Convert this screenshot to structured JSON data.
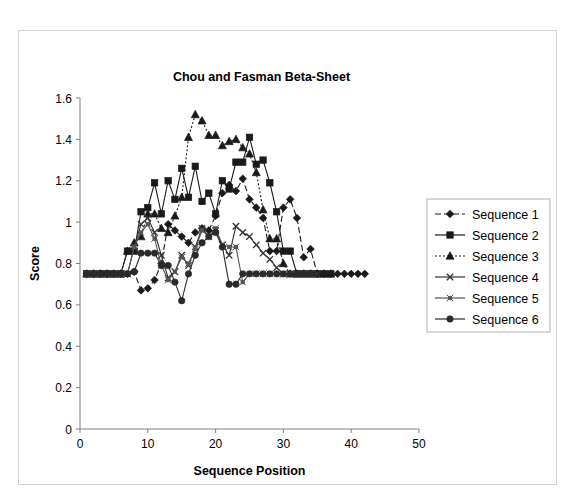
{
  "figure": {
    "border_color": "#d3d3d3",
    "background": "#ffffff"
  },
  "chart_data": {
    "type": "line",
    "title": "Chou and Fasman Beta-Sheet",
    "xlabel": "Sequence Position",
    "ylabel": "Score",
    "xlim": [
      0,
      50
    ],
    "ylim": [
      0,
      1.6
    ],
    "xticks": [
      0,
      10,
      20,
      30,
      40,
      50
    ],
    "yticks": [
      0,
      0.2,
      0.4,
      0.6,
      0.8,
      1,
      1.2,
      1.4,
      1.6
    ],
    "xtick_labels": [
      "0",
      "10",
      "20",
      "30",
      "40",
      "50"
    ],
    "ytick_labels": [
      "0",
      "0.2",
      "0.4",
      "0.6",
      "0.8",
      "1",
      "1.2",
      "1.4",
      "1.6"
    ],
    "grid": false,
    "legend_position": "right",
    "baseline_value": 0.75,
    "series": [
      {
        "name": "Sequence 1",
        "marker": "diamond",
        "linestyle": "dashed",
        "color": "#1a1a1a",
        "x": [
          1,
          2,
          3,
          4,
          5,
          6,
          7,
          8,
          9,
          10,
          11,
          12,
          13,
          14,
          15,
          16,
          17,
          18,
          19,
          20,
          21,
          22,
          23,
          24,
          25,
          26,
          27,
          28,
          29,
          30,
          31,
          32,
          33,
          34,
          35,
          36,
          37,
          38,
          39,
          40,
          41,
          42
        ],
        "y": [
          0.75,
          0.75,
          0.75,
          0.75,
          0.75,
          0.75,
          0.75,
          0.76,
          0.67,
          0.68,
          0.72,
          0.8,
          0.99,
          0.96,
          0.93,
          0.9,
          0.95,
          0.97,
          0.96,
          1.03,
          1.14,
          1.18,
          1.15,
          1.21,
          1.11,
          1.07,
          1.02,
          0.86,
          0.86,
          1.07,
          1.11,
          1.02,
          0.83,
          0.87,
          0.75,
          0.75,
          0.75,
          0.75,
          0.75,
          0.75,
          0.75,
          0.75
        ]
      },
      {
        "name": "Sequence 2",
        "marker": "square",
        "linestyle": "solid",
        "color": "#1a1a1a",
        "x": [
          1,
          2,
          3,
          4,
          5,
          6,
          7,
          8,
          9,
          10,
          11,
          12,
          13,
          14,
          15,
          16,
          17,
          18,
          19,
          20,
          21,
          22,
          23,
          24,
          25,
          26,
          27,
          28,
          29,
          30,
          31,
          32,
          33,
          34,
          35,
          36,
          37
        ],
        "y": [
          0.75,
          0.75,
          0.75,
          0.75,
          0.75,
          0.75,
          0.86,
          0.86,
          1.05,
          1.07,
          1.19,
          1.04,
          1.2,
          1.11,
          1.26,
          1.12,
          1.27,
          1.1,
          1.14,
          1.04,
          1.2,
          1.16,
          1.29,
          1.29,
          1.41,
          1.28,
          1.3,
          1.19,
          1.05,
          0.86,
          0.86,
          0.75,
          0.75,
          0.75,
          0.75,
          0.75,
          0.75
        ]
      },
      {
        "name": "Sequence 3",
        "marker": "triangle",
        "linestyle": "dotted",
        "color": "#1a1a1a",
        "x": [
          1,
          2,
          3,
          4,
          5,
          6,
          7,
          8,
          9,
          10,
          11,
          12,
          13,
          14,
          15,
          16,
          17,
          18,
          19,
          20,
          21,
          22,
          23,
          24,
          25,
          26,
          27,
          28,
          29,
          30,
          31,
          32,
          33,
          34,
          35,
          36,
          37
        ],
        "y": [
          0.75,
          0.75,
          0.75,
          0.75,
          0.75,
          0.75,
          0.86,
          0.9,
          0.93,
          1.04,
          1.04,
          0.97,
          0.95,
          1.03,
          1.12,
          1.41,
          1.52,
          1.49,
          1.42,
          1.42,
          1.37,
          1.39,
          1.4,
          1.36,
          1.33,
          1.24,
          1.06,
          0.92,
          0.92,
          0.8,
          0.75,
          0.75,
          0.75,
          0.75,
          0.75,
          0.75,
          0.75
        ]
      },
      {
        "name": "Sequence 4",
        "marker": "x",
        "linestyle": "solid",
        "color": "#333333",
        "x": [
          1,
          2,
          3,
          4,
          5,
          6,
          7,
          8,
          9,
          10,
          11,
          12,
          13,
          14,
          15,
          16,
          17,
          18,
          19,
          20,
          21,
          22,
          23,
          24,
          25,
          26,
          27,
          28,
          29,
          30,
          31,
          32,
          33,
          34,
          35
        ],
        "y": [
          0.75,
          0.75,
          0.75,
          0.75,
          0.75,
          0.75,
          0.75,
          0.88,
          0.99,
          1.02,
          0.95,
          0.84,
          0.73,
          0.76,
          0.84,
          0.79,
          0.88,
          0.97,
          0.93,
          0.96,
          0.89,
          0.84,
          0.98,
          0.95,
          0.93,
          0.89,
          0.85,
          0.82,
          0.78,
          0.75,
          0.75,
          0.75,
          0.75,
          0.75,
          0.75
        ]
      },
      {
        "name": "Sequence 5",
        "marker": "star",
        "linestyle": "solid",
        "color": "#555555",
        "x": [
          1,
          2,
          3,
          4,
          5,
          6,
          7,
          8,
          9,
          10,
          11,
          12,
          13,
          14,
          15,
          16,
          17,
          18,
          19,
          20,
          21,
          22,
          23,
          24,
          25,
          26,
          27,
          28,
          29,
          30,
          31,
          32,
          33,
          34
        ],
        "y": [
          0.75,
          0.75,
          0.75,
          0.75,
          0.75,
          0.75,
          0.75,
          0.88,
          0.95,
          0.99,
          0.92,
          0.79,
          0.72,
          0.76,
          0.83,
          0.8,
          0.87,
          0.96,
          0.93,
          0.97,
          0.89,
          0.88,
          0.88,
          0.71,
          0.75,
          0.75,
          0.75,
          0.75,
          0.75,
          0.75,
          0.75,
          0.75,
          0.75,
          0.75
        ]
      },
      {
        "name": "Sequence 6",
        "marker": "circle",
        "linestyle": "solid",
        "color": "#2a2a2a",
        "x": [
          1,
          2,
          3,
          4,
          5,
          6,
          7,
          8,
          9,
          10,
          11,
          12,
          13,
          14,
          15,
          16,
          17,
          18,
          19,
          20,
          21,
          22,
          23,
          24,
          25,
          26,
          27,
          28,
          29,
          30,
          31,
          32,
          33,
          34
        ],
        "y": [
          0.75,
          0.75,
          0.75,
          0.75,
          0.75,
          0.75,
          0.75,
          0.76,
          0.85,
          0.85,
          0.85,
          0.79,
          0.79,
          0.71,
          0.62,
          0.75,
          0.84,
          0.9,
          0.93,
          0.95,
          0.88,
          0.7,
          0.7,
          0.75,
          0.75,
          0.75,
          0.75,
          0.75,
          0.75,
          0.75,
          0.75,
          0.75,
          0.75,
          0.75
        ]
      }
    ]
  }
}
